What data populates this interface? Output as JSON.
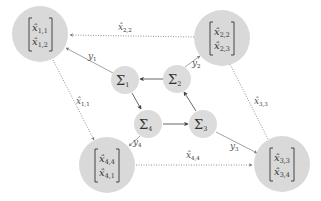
{
  "diagram": {
    "type": "network-flow",
    "nodes": {
      "agent1": {
        "id": "agent-1",
        "entries": [
          {
            "base": "x̂",
            "sub": "1,1"
          },
          {
            "base": "x̂",
            "sub": "1,2"
          }
        ]
      },
      "agent2": {
        "id": "agent-2",
        "entries": [
          {
            "base": "x̂",
            "sub": "2,2"
          },
          {
            "base": "x̂",
            "sub": "2,3"
          }
        ]
      },
      "agent3": {
        "id": "agent-3",
        "entries": [
          {
            "base": "x̂",
            "sub": "3,3"
          },
          {
            "base": "x̂",
            "sub": "3,4"
          }
        ]
      },
      "agent4": {
        "id": "agent-4",
        "entries": [
          {
            "base": "x̂",
            "sub": "4,4"
          },
          {
            "base": "x̂",
            "sub": "4,1"
          }
        ]
      },
      "sum1": {
        "symbol": "Σ",
        "sub": "1"
      },
      "sum2": {
        "symbol": "Σ",
        "sub": "2"
      },
      "sum3": {
        "symbol": "Σ",
        "sub": "3"
      },
      "sum4": {
        "symbol": "Σ",
        "sub": "4"
      }
    },
    "edges": {
      "y1": {
        "base": "y",
        "sub": "1",
        "from": "sum1",
        "to": "agent1",
        "style": "solid"
      },
      "y2": {
        "base": "y",
        "sub": "2",
        "from": "sum2",
        "to": "agent2",
        "style": "solid"
      },
      "y3": {
        "base": "y",
        "sub": "3",
        "from": "sum3",
        "to": "agent3",
        "style": "solid"
      },
      "y4": {
        "base": "y",
        "sub": "4",
        "from": "sum4",
        "to": "agent4",
        "style": "solid"
      },
      "x11": {
        "base": "x̂",
        "sub": "1,1",
        "from": "agent1",
        "to": "agent4",
        "style": "dotted"
      },
      "x22": {
        "base": "x̂",
        "sub": "2,2",
        "from": "agent2",
        "to": "agent1",
        "style": "dotted"
      },
      "x33": {
        "base": "x̂",
        "sub": "3,3",
        "from": "agent3",
        "to": "agent2",
        "style": "dotted"
      },
      "x44": {
        "base": "x̂",
        "sub": "4,4",
        "from": "agent4",
        "to": "agent3",
        "style": "dotted"
      },
      "s2s1": {
        "from": "sum2",
        "to": "sum1",
        "style": "solid"
      },
      "s1s4": {
        "from": "sum1",
        "to": "sum4",
        "style": "solid"
      },
      "s4s3": {
        "from": "sum4",
        "to": "sum3",
        "style": "solid"
      },
      "s3s2": {
        "from": "sum3",
        "to": "sum2",
        "style": "solid"
      }
    },
    "colors": {
      "node_fill": "#d9d9d9",
      "edge": "#555555",
      "text": "#333333"
    }
  }
}
